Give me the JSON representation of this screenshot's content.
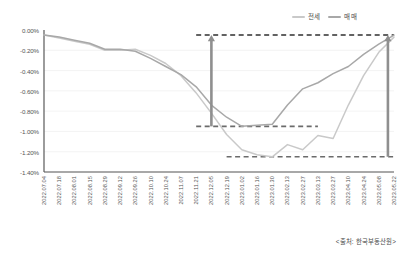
{
  "legend": {
    "position": "top-right",
    "items": [
      {
        "label": "전세",
        "color": "#c9c9c9",
        "key": "jeonse"
      },
      {
        "label": "매매",
        "color": "#a8a8a8",
        "key": "maemae"
      }
    ]
  },
  "source": {
    "text": "<출처: 한국부동산원>"
  },
  "chart_data": {
    "type": "line",
    "title": "",
    "subtitle": "",
    "xlabel": "",
    "ylabel": "",
    "ylim": [
      -1.4,
      0.0
    ],
    "ytick_labels": [
      "0.00%",
      "-0.20%",
      "-0.40%",
      "-0.60%",
      "-0.80%",
      "-1.00%",
      "-1.20%",
      "-1.40%"
    ],
    "ytick_values": [
      0.0,
      -0.2,
      -0.4,
      -0.6,
      -0.8,
      -1.0,
      -1.2,
      -1.4
    ],
    "grid": true,
    "grid_axis": "y",
    "legend_position": "top-right",
    "categories": [
      "2022.07.04",
      "2022.07.18",
      "2022.08.01",
      "2022.08.15",
      "2022.08.29",
      "2022.09.12",
      "2022.09.26",
      "2022.10.10",
      "2022.10.24",
      "2022.11.07",
      "2022.11.21",
      "2022.12.05",
      "2022.12.19",
      "2023.01.02",
      "2023.01.16",
      "2023.01.30",
      "2023.02.13",
      "2023.02.27",
      "2023.03.13",
      "2023.03.27",
      "2023.04.10",
      "2023.04.24",
      "2023.05.08",
      "2023.05.22"
    ],
    "series": [
      {
        "name": "전세",
        "color": "#c9c9c9",
        "values": [
          -0.05,
          -0.08,
          -0.11,
          -0.14,
          -0.2,
          -0.2,
          -0.19,
          -0.25,
          -0.33,
          -0.45,
          -0.62,
          -0.82,
          -1.03,
          -1.18,
          -1.23,
          -1.25,
          -1.13,
          -1.18,
          -1.04,
          -1.07,
          -0.74,
          -0.45,
          -0.22,
          -0.07
        ]
      },
      {
        "name": "매매",
        "color": "#a8a8a8",
        "values": [
          -0.05,
          -0.07,
          -0.1,
          -0.13,
          -0.19,
          -0.19,
          -0.21,
          -0.28,
          -0.36,
          -0.44,
          -0.56,
          -0.74,
          -0.86,
          -0.95,
          -0.94,
          -0.93,
          -0.74,
          -0.58,
          -0.52,
          -0.43,
          -0.36,
          -0.24,
          -0.14,
          -0.05
        ]
      }
    ],
    "reference_lines": [
      {
        "name": "baseline-top",
        "value": -0.05,
        "style": "dashed",
        "color": "#2f2f2f",
        "x_start_index": 10,
        "x_end_index": 23
      },
      {
        "name": "maemae-trough",
        "value": -0.95,
        "style": "dashed",
        "color": "#6b6b6b",
        "x_start_index": 10,
        "x_end_index": 18
      },
      {
        "name": "jeonse-trough",
        "value": -1.25,
        "style": "dashed",
        "color": "#6b6b6b",
        "x_start_index": 12,
        "x_end_index": 23
      }
    ],
    "annotations": [
      {
        "name": "recovery-arrow-maemae",
        "type": "arrow",
        "x_index": 11,
        "y_from": -0.95,
        "y_to": -0.05,
        "color": "#8f8f8f"
      },
      {
        "name": "recovery-arrow-jeonse",
        "type": "arrow",
        "x_index": 22.6,
        "y_from": -1.25,
        "y_to": -0.05,
        "color": "#8f8f8f"
      }
    ]
  }
}
